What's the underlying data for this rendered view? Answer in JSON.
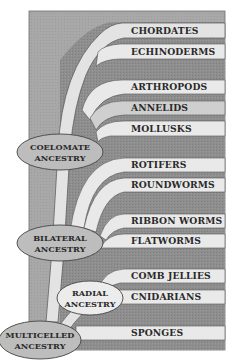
{
  "diagram": {
    "type": "phylogenetic-tree",
    "colors": {
      "background": "#ffffff",
      "frame": "#a6a6a6",
      "dark_band": "#8e8e8e",
      "light_band": "#e9e9e9",
      "outline": "#555555",
      "ellipse_fill": "#bdbdbd",
      "ellipse_light": "#ececec",
      "text": "#2a2a2a"
    },
    "groups": [
      {
        "label": "CHORDATES",
        "y": 31
      },
      {
        "label": "ECHINODERMS",
        "y": 52
      },
      {
        "label": "ARTHROPODS",
        "y": 87
      },
      {
        "label": "ANNELIDS",
        "y": 108
      },
      {
        "label": "MOLLUSKS",
        "y": 129
      },
      {
        "label": "ROTIFERS",
        "y": 165
      },
      {
        "label": "ROUNDWORMS",
        "y": 185
      },
      {
        "label": "RIBBON WORMS",
        "y": 221
      },
      {
        "label": "FLATWORMS",
        "y": 241
      },
      {
        "label": "COMB JELLIES",
        "y": 276
      },
      {
        "label": "CNIDARIANS",
        "y": 297
      },
      {
        "label": "SPONGES",
        "y": 333
      }
    ],
    "ancestors": [
      {
        "id": "coelomate",
        "line1": "COELOMATE",
        "line2": "ANCESTRY",
        "cx": 60,
        "cy": 152,
        "rx": 43,
        "ry": 18
      },
      {
        "id": "bilateral",
        "line1": "BILATERAL",
        "line2": "ANCESTRY",
        "cx": 60,
        "cy": 243,
        "rx": 43,
        "ry": 18
      },
      {
        "id": "radial",
        "line1": "RADIAL",
        "line2": "ANCESTRY",
        "cx": 90,
        "cy": 298,
        "rx": 33,
        "ry": 17
      },
      {
        "id": "multicelled",
        "line1": "MULTICELLED",
        "line2": "ANCESTRY",
        "cx": 40,
        "cy": 340,
        "rx": 41,
        "ry": 19
      }
    ]
  }
}
